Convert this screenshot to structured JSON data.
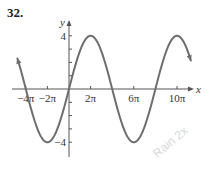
{
  "problem_number": "32.",
  "watermark": "Rain 2x",
  "chart_data": {
    "type": "line",
    "title": "",
    "function": "y = 4 sin(x/4)",
    "xlabel": "x",
    "ylabel": "y",
    "x_tick_labels": [
      "-4π",
      "-2π",
      "2π",
      "6π",
      "10π"
    ],
    "x_tick_values_in_pi": [
      -4,
      -2,
      2,
      6,
      10
    ],
    "y_tick_labels": [
      "4",
      "-4"
    ],
    "y_tick_values": [
      4,
      -4
    ],
    "y_minor_ticks": [
      -4,
      -3,
      -2,
      -1,
      1,
      2,
      3,
      4
    ],
    "xlim_in_pi": [
      -4.8,
      11.3
    ],
    "ylim": [
      -4.5,
      4.5
    ],
    "amplitude": 4,
    "period": "8π",
    "key_points_in_pi": [
      {
        "x": -4,
        "y": 0
      },
      {
        "x": -2,
        "y": -4
      },
      {
        "x": 0,
        "y": 0
      },
      {
        "x": 2,
        "y": 4
      },
      {
        "x": 4,
        "y": 0
      },
      {
        "x": 6,
        "y": -4
      },
      {
        "x": 8,
        "y": 0
      },
      {
        "x": 10,
        "y": 4
      }
    ],
    "grid": false,
    "line_color": "#6e6e6e",
    "axis_color": "#555555"
  }
}
